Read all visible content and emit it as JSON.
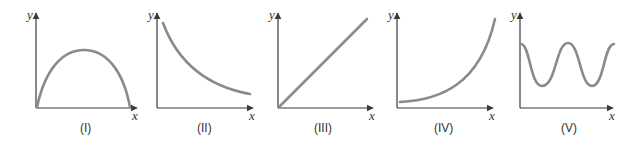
{
  "figure": {
    "panels": [
      {
        "id": "I",
        "label": "(I)",
        "x_axis_label": "x",
        "y_axis_label": "y",
        "shape": "downward parabola / arch starting at origin"
      },
      {
        "id": "II",
        "label": "(II)",
        "x_axis_label": "x",
        "y_axis_label": "y",
        "shape": "decreasing decay curve"
      },
      {
        "id": "III",
        "label": "(III)",
        "x_axis_label": "x",
        "y_axis_label": "y",
        "shape": "straight line through origin"
      },
      {
        "id": "IV",
        "label": "(IV)",
        "x_axis_label": "x",
        "y_axis_label": "y",
        "shape": "increasing exponential-like curve"
      },
      {
        "id": "V",
        "label": "(V)",
        "x_axis_label": "x",
        "y_axis_label": "y",
        "shape": "periodic wave (oscillation)"
      }
    ],
    "colors": {
      "axis": "#3a3a3a",
      "curve": "#8a8a8a",
      "background": "#ffffff"
    }
  }
}
